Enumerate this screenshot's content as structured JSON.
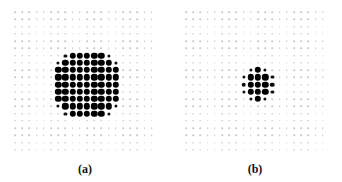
{
  "figure": {
    "panels": [
      {
        "id": "a",
        "caption": "(a)",
        "grid": {
          "cols": 20,
          "rows": 20,
          "x0": 15,
          "y0": 12,
          "pitch_x": 7.2,
          "pitch_y": 7.25
        },
        "block": {
          "col_start": 6,
          "row_start": 6,
          "pattern": [
            ". s b b b b b s .",
            "s b b b b b b b s",
            "b b b b b b b b b",
            "b b b b b b b b b",
            "b b b b b b b b b",
            "b b b b b b b b b",
            "b b b b b b b b b",
            "s b b b b b b b s",
            ". s b b b b b s ."
          ]
        },
        "caption_x": 85
      },
      {
        "id": "b",
        "caption": "(b)",
        "grid": {
          "cols": 20,
          "rows": 20,
          "x0": 186,
          "y0": 12,
          "pitch_x": 7.2,
          "pitch_y": 7.25
        },
        "block": {
          "col_start": 8,
          "row_start": 8,
          "pattern": [
            ". s b s .",
            "s b b b s",
            "m b b b m",
            "s b b b s",
            ". s b s ."
          ]
        },
        "caption_x": 255
      }
    ]
  }
}
